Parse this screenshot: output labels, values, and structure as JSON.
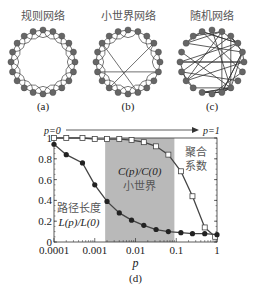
{
  "networks": [
    {
      "title": "规则网络",
      "caption": "(a)",
      "cx": 43,
      "cy": 62,
      "type": "regular"
    },
    {
      "title": "小世界网络",
      "caption": "(b)",
      "cx": 128,
      "cy": 62,
      "type": "smallworld"
    },
    {
      "title": "随机网络",
      "caption": "(c)",
      "cx": 212,
      "cy": 62,
      "type": "random"
    }
  ],
  "arrow": {
    "left_label": "p=0",
    "right_label": "p=1"
  },
  "chart_data": {
    "type": "line",
    "xscale": "log",
    "xlabel": "p",
    "ylabel": "",
    "caption": "(d)",
    "xlim": [
      0.0001,
      1
    ],
    "ylim": [
      0,
      1
    ],
    "xticks": [
      "0.0001",
      "0.001",
      "0.01",
      "0.1",
      "1"
    ],
    "yticks": [
      "0",
      "0.2",
      "0.4",
      "0.6",
      "0.8",
      "1"
    ],
    "shaded_region": {
      "x": [
        0.0018,
        0.09
      ],
      "label_top": "C(p)/C(0)",
      "label_bottom": "小世界"
    },
    "annotations": [
      {
        "text": "聚合系数",
        "series": "C(p)/C(0)"
      },
      {
        "text": "路径长度",
        "sub": "L(p)/L(0)",
        "series": "L(p)/L(0)"
      }
    ],
    "series": [
      {
        "name": "C(p)/C(0)",
        "marker": "open-square",
        "x": [
          0.0001,
          0.0002,
          0.0005,
          0.001,
          0.002,
          0.004,
          0.008,
          0.016,
          0.032,
          0.064,
          0.13,
          0.25,
          0.5,
          0.9
        ],
        "values": [
          1.0,
          1.0,
          1.0,
          0.99,
          0.99,
          0.99,
          0.98,
          0.96,
          0.92,
          0.84,
          0.68,
          0.44,
          0.14,
          0.05
        ]
      },
      {
        "name": "L(p)/L(0)",
        "marker": "filled-circle",
        "x": [
          0.0001,
          0.0002,
          0.0005,
          0.001,
          0.002,
          0.004,
          0.008,
          0.016,
          0.032,
          0.064,
          0.13,
          0.25,
          0.5,
          1.0
        ],
        "values": [
          0.94,
          0.84,
          0.76,
          0.55,
          0.39,
          0.28,
          0.21,
          0.16,
          0.12,
          0.1,
          0.09,
          0.08,
          0.08,
          0.07
        ]
      }
    ]
  }
}
